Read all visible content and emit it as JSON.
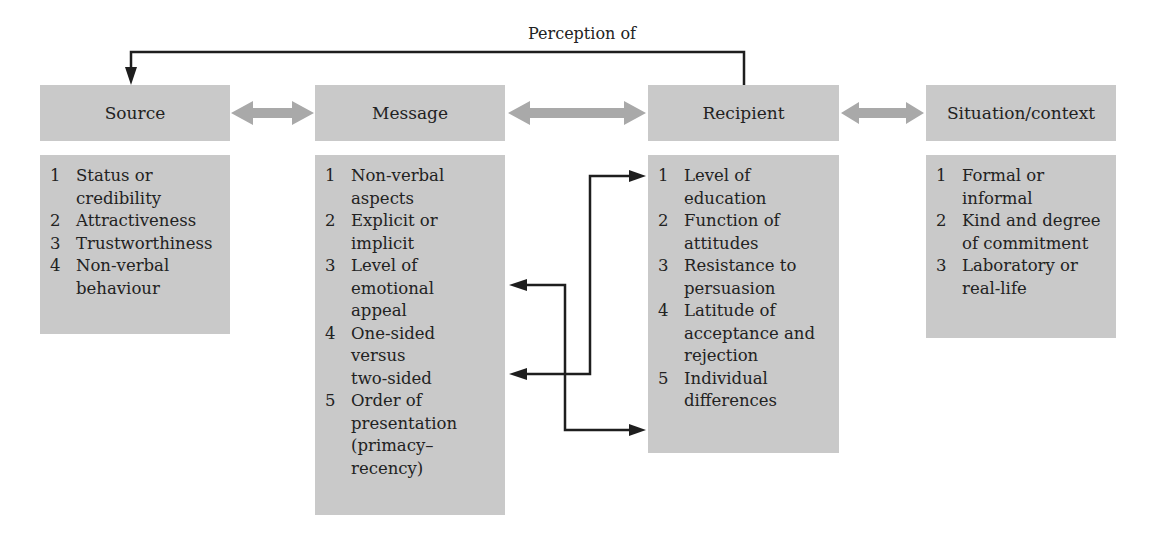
{
  "feedback_label": "Perception of",
  "headers": {
    "source": "Source",
    "message": "Message",
    "recipient": "Recipient",
    "situation": "Situation/context"
  },
  "lists": {
    "source": [
      {
        "n": "1",
        "text": "Status or\ncredibility"
      },
      {
        "n": "2",
        "text": "Attractiveness"
      },
      {
        "n": "3",
        "text": "Trustworthiness"
      },
      {
        "n": "4",
        "text": "Non-verbal\nbehaviour"
      }
    ],
    "message": [
      {
        "n": "1",
        "text": "Non-verbal\naspects"
      },
      {
        "n": "2",
        "text": "Explicit or\nimplicit"
      },
      {
        "n": "3",
        "text": "Level of\nemotional\nappeal"
      },
      {
        "n": "4",
        "text": "One-sided\nversus\ntwo-sided"
      },
      {
        "n": "5",
        "text": "Order of\npresentation\n(primacy–\nrecency)"
      }
    ],
    "recipient": [
      {
        "n": "1",
        "text": "Level of\neducation"
      },
      {
        "n": "2",
        "text": "Function of\nattitudes"
      },
      {
        "n": "3",
        "text": "Resistance to\npersuasion"
      },
      {
        "n": "4",
        "text": "Latitude of\nacceptance and\nrejection"
      },
      {
        "n": "5",
        "text": "Individual\ndifferences"
      }
    ],
    "situation": [
      {
        "n": "1",
        "text": "Formal or\ninformal"
      },
      {
        "n": "2",
        "text": "Kind and degree\nof commitment"
      },
      {
        "n": "3",
        "text": "Laboratory or\nreal-life"
      }
    ]
  },
  "colors": {
    "box_fill": "#c9c9c9",
    "double_arrow": "#a9a9a9",
    "line": "#1e1e1e"
  }
}
